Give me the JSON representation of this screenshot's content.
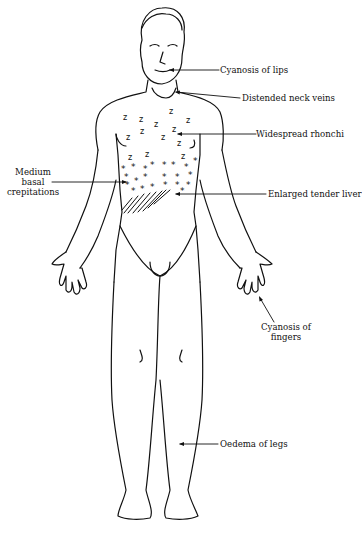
{
  "diagram": {
    "type": "anatomical-illustration",
    "colors": {
      "ink": "#111111",
      "background": "#ffffff"
    },
    "labels": {
      "cyanosis_lips": "Cyanosis of lips",
      "neck_veins": "Distended neck veins",
      "rhonchi": "Widespread rhonchi",
      "crepitations_line1": "Medium",
      "crepitations_line2": "basal",
      "crepitations_line3": "crepitations",
      "liver": "Enlarged tender liver",
      "fingers_line1": "Cyanosis of",
      "fingers_line2": "fingers",
      "oedema": "Oedema of legs"
    },
    "markers": {
      "rhonchi_symbol": "z",
      "crepitation_symbol": "*",
      "liver_marking": "diagonal hatching"
    }
  }
}
